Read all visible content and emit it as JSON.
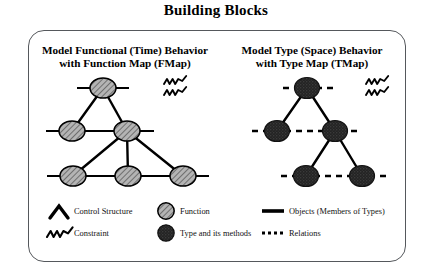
{
  "title": "Building Blocks",
  "panels": {
    "left": {
      "heading_line1": "Model Functional (Time) Behavior",
      "heading_line2": "with Function Map (FMap)"
    },
    "right": {
      "heading_line1": "Model Type (Space) Behavior",
      "heading_line2": "with Type Map (TMap)"
    }
  },
  "legend": {
    "control_structure": "Control Structure",
    "constraint": "Constraint",
    "function": "Function",
    "type_and_methods": "Type and its methods",
    "objects": "Objects (Members of Types)",
    "relations": "Relations"
  },
  "colors": {
    "ink": "#000000",
    "frame": "#55585c",
    "function_fill": "#a8a8a8",
    "type_fill": "#2b2b2b",
    "background": "#ffffff"
  },
  "diagram": {
    "fmap": {
      "node_style": "hatched-light-circle",
      "edge_style": "solid",
      "object_line_style": "solid",
      "nodes": [
        {
          "id": "f1",
          "cx": 103,
          "cy": 88,
          "level": 1
        },
        {
          "id": "f2",
          "cx": 72,
          "cy": 131,
          "level": 2
        },
        {
          "id": "f3",
          "cx": 127,
          "cy": 131,
          "level": 2
        },
        {
          "id": "f4",
          "cx": 73,
          "cy": 176,
          "level": 3
        },
        {
          "id": "f5",
          "cx": 128,
          "cy": 176,
          "level": 3
        },
        {
          "id": "f6",
          "cx": 183,
          "cy": 176,
          "level": 3
        }
      ],
      "edges": [
        {
          "from": "f1",
          "to": "f2"
        },
        {
          "from": "f1",
          "to": "f3"
        },
        {
          "from": "f3",
          "to": "f4"
        },
        {
          "from": "f3",
          "to": "f5"
        },
        {
          "from": "f3",
          "to": "f6"
        }
      ],
      "constraint_marks": 2
    },
    "tmap": {
      "node_style": "filled-dark-circle",
      "edge_style": "solid",
      "relation_line_style": "dashed",
      "nodes": [
        {
          "id": "t1",
          "cx": 307,
          "cy": 88,
          "level": 1
        },
        {
          "id": "t2",
          "cx": 277,
          "cy": 131,
          "level": 2
        },
        {
          "id": "t3",
          "cx": 335,
          "cy": 131,
          "level": 2
        },
        {
          "id": "t4",
          "cx": 306,
          "cy": 176,
          "level": 3
        },
        {
          "id": "t5",
          "cx": 362,
          "cy": 176,
          "level": 3
        }
      ],
      "edges": [
        {
          "from": "t1",
          "to": "t2"
        },
        {
          "from": "t1",
          "to": "t3"
        },
        {
          "from": "t3",
          "to": "t4"
        },
        {
          "from": "t3",
          "to": "t5"
        }
      ],
      "constraint_marks": 2
    }
  }
}
